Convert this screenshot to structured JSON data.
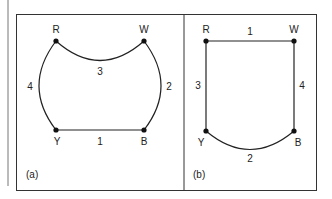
{
  "figure": {
    "panels": [
      {
        "id": "a",
        "caption": "(a)",
        "nodes": {
          "R": "R",
          "W": "W",
          "Y": "Y",
          "B": "B"
        },
        "edges": [
          {
            "from": "Y",
            "to": "B",
            "label": "1",
            "shape": "straight"
          },
          {
            "from": "W",
            "to": "B",
            "label": "2",
            "shape": "arc"
          },
          {
            "from": "R",
            "to": "W",
            "label": "3",
            "shape": "arc"
          },
          {
            "from": "R",
            "to": "Y",
            "label": "4",
            "shape": "arc"
          }
        ]
      },
      {
        "id": "b",
        "caption": "(b)",
        "nodes": {
          "R": "R",
          "W": "W",
          "Y": "Y",
          "B": "B"
        },
        "edges": [
          {
            "from": "R",
            "to": "W",
            "label": "1",
            "shape": "straight"
          },
          {
            "from": "Y",
            "to": "B",
            "label": "2",
            "shape": "arc"
          },
          {
            "from": "R",
            "to": "Y",
            "label": "3",
            "shape": "straight"
          },
          {
            "from": "W",
            "to": "B",
            "label": "4",
            "shape": "straight"
          }
        ]
      }
    ],
    "colors": {
      "line": "#222222",
      "frame": "#333333",
      "background": "#ffffff"
    }
  }
}
